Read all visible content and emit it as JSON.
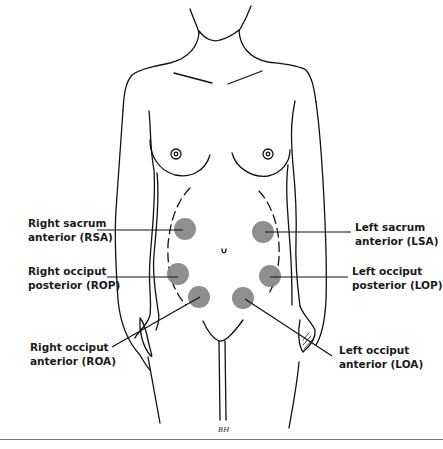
{
  "figure": {
    "colors": {
      "line": "#111111",
      "circle_fill": "#8a8a8a",
      "background": "#ffffff"
    },
    "artist_initials": "BH"
  },
  "positions": [
    {
      "id": "RSA",
      "line1": "Right sacrum",
      "line2": "anterior (RSA)",
      "side": "left",
      "cx": 185,
      "cy": 229
    },
    {
      "id": "ROP",
      "line1": "Right occiput",
      "line2": "posterior (ROP)",
      "side": "left",
      "cx": 178,
      "cy": 274
    },
    {
      "id": "ROA",
      "line1": "Right occiput",
      "line2": "anterior (ROA)",
      "side": "left",
      "cx": 199,
      "cy": 297
    },
    {
      "id": "LSA",
      "line1": "Left sacrum",
      "line2": "anterior (LSA)",
      "side": "right",
      "cx": 263,
      "cy": 232
    },
    {
      "id": "LOP",
      "line1": "Left occiput",
      "line2": "posterior (LOP)",
      "side": "right",
      "cx": 270,
      "cy": 276
    },
    {
      "id": "LOA",
      "line1": "Left occiput",
      "line2": "anterior (LOA)",
      "side": "right",
      "cx": 243,
      "cy": 298
    }
  ]
}
